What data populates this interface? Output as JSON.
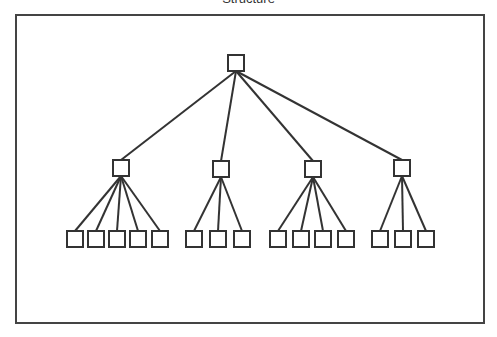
{
  "title": "Structure",
  "diagram": {
    "type": "tree",
    "root": {
      "id": "root",
      "x": 228,
      "y": 55,
      "w": 16,
      "h": 16
    },
    "level2": [
      {
        "id": "n1",
        "x": 113,
        "y": 160,
        "children": [
          67,
          88,
          109,
          130,
          152
        ]
      },
      {
        "id": "n2",
        "x": 213,
        "y": 161,
        "children": [
          186,
          210,
          234
        ]
      },
      {
        "id": "n3",
        "x": 305,
        "y": 161,
        "children": [
          270,
          293,
          315,
          338
        ]
      },
      {
        "id": "n4",
        "x": 394,
        "y": 160,
        "children": [
          372,
          395,
          418
        ]
      }
    ],
    "leaf_y": 231,
    "box_size": 16,
    "colors": {
      "stroke": "#333333",
      "frame": "#444444"
    }
  }
}
